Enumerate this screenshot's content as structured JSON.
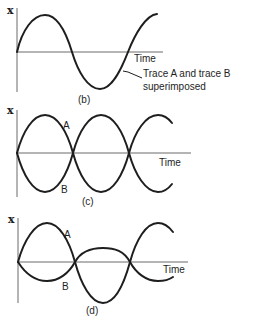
{
  "panels": [
    {
      "id": "b",
      "caption": "(b)",
      "y_axis_label": "x",
      "x_axis_label": "Time",
      "annotation_line1": "Trace A and trace B",
      "annotation_line2": "superimposed"
    },
    {
      "id": "c",
      "caption": "(c)",
      "y_axis_label": "x",
      "x_axis_label": "Time",
      "trace_a_label": "A",
      "trace_b_label": "B"
    },
    {
      "id": "d",
      "caption": "(d)",
      "y_axis_label": "x",
      "x_axis_label": "Time",
      "trace_a_label": "A",
      "trace_b_label": "B"
    }
  ],
  "colors": {
    "trace": "#1e1e1e",
    "axis": "#6a6a6a",
    "background": "#ffffff"
  }
}
